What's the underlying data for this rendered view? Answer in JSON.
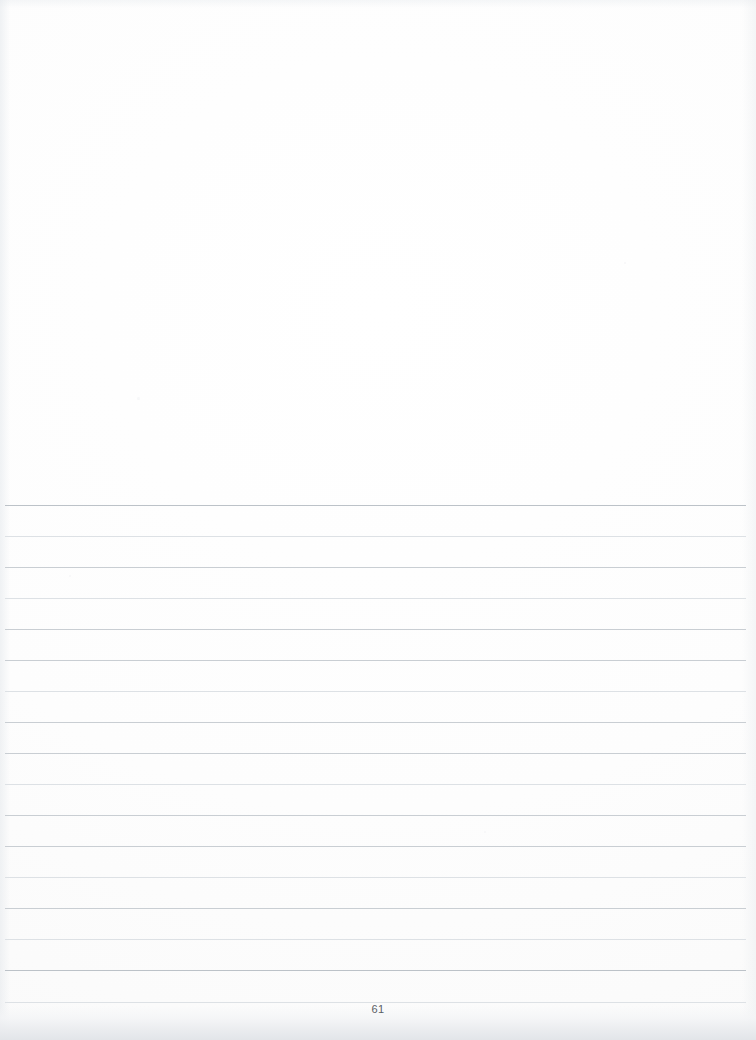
{
  "document": {
    "type": "scanned-lined-notebook-page",
    "page_number": "61",
    "content_text": "",
    "paper_color": "#fefefe",
    "rule_color": "#c9ced3",
    "page_number_color": "#5a5f65"
  },
  "layout": {
    "blank_top_region": {
      "top": 0,
      "height": 505,
      "note": "unruled blank upper portion of the page"
    },
    "ruled_region": {
      "first_line_y": 505,
      "last_line_y": 1002,
      "line_spacing": 31,
      "line_count": 17,
      "line_left": 5,
      "line_right_inset": 10
    }
  },
  "rules": [
    {
      "y": 505,
      "weight": "strong"
    },
    {
      "y": 536,
      "weight": "faint"
    },
    {
      "y": 567,
      "weight": "normal"
    },
    {
      "y": 598,
      "weight": "faint"
    },
    {
      "y": 629,
      "weight": "normal"
    },
    {
      "y": 660,
      "weight": "normal"
    },
    {
      "y": 691,
      "weight": "faint"
    },
    {
      "y": 722,
      "weight": "normal"
    },
    {
      "y": 753,
      "weight": "normal"
    },
    {
      "y": 784,
      "weight": "faint"
    },
    {
      "y": 815,
      "weight": "normal"
    },
    {
      "y": 846,
      "weight": "normal"
    },
    {
      "y": 877,
      "weight": "faint"
    },
    {
      "y": 908,
      "weight": "normal"
    },
    {
      "y": 939,
      "weight": "faint"
    },
    {
      "y": 970,
      "weight": "strong"
    },
    {
      "y": 1002,
      "weight": "faint"
    }
  ],
  "page_number_position": {
    "y": 1002,
    "align": "center"
  },
  "specks": [
    {
      "x": 137,
      "y": 397,
      "size": 3
    },
    {
      "x": 484,
      "y": 831,
      "size": 2
    },
    {
      "x": 69,
      "y": 575,
      "size": 2
    },
    {
      "x": 624,
      "y": 262,
      "size": 2
    }
  ]
}
